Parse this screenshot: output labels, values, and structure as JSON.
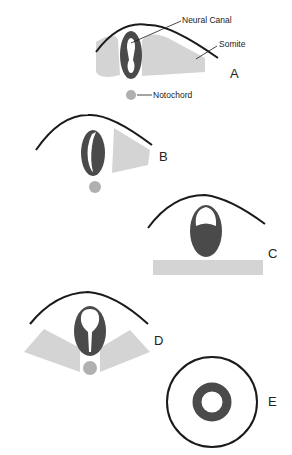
{
  "diagram": {
    "type": "neural tube development stages",
    "colors": {
      "ectoderm_line": "#1a1a1a",
      "neural_tube": "#4a4a4a",
      "somite": "#d4d4d4",
      "notochord": "#b0b0b0",
      "lumen": "#ffffff"
    },
    "annotations": {
      "neural_canal": "Neural Canal",
      "somite": "Somite",
      "notochord": "Notochord"
    },
    "panels": [
      {
        "id": "A",
        "label": "A"
      },
      {
        "id": "B",
        "label": "B"
      },
      {
        "id": "C",
        "label": "C"
      },
      {
        "id": "D",
        "label": "D"
      },
      {
        "id": "E",
        "label": "E"
      }
    ]
  }
}
